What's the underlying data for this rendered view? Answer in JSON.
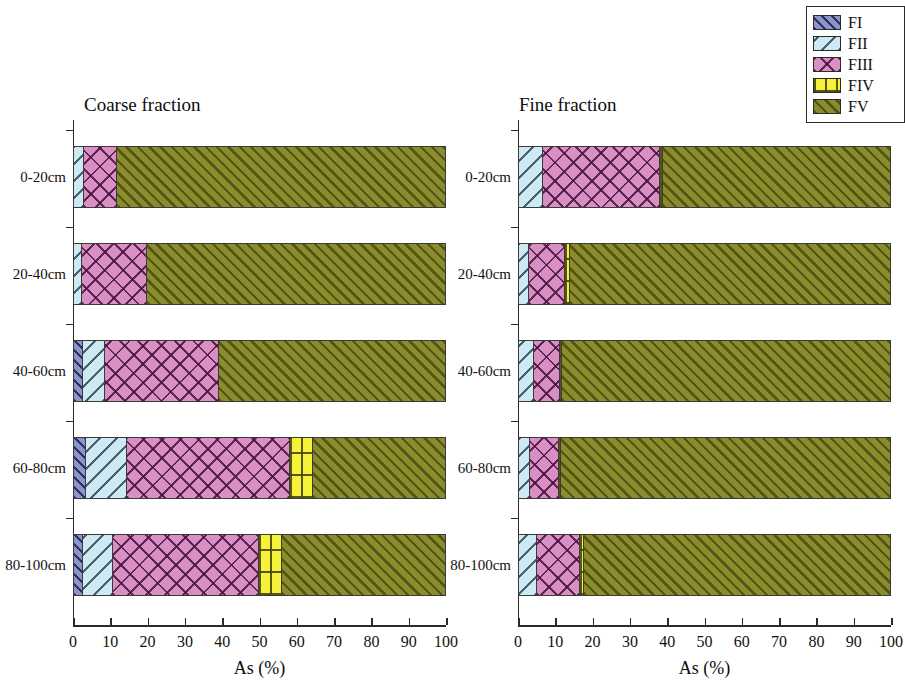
{
  "figure": {
    "axis_title": "As (%)",
    "xticks": [
      0,
      10,
      20,
      30,
      40,
      50,
      60,
      70,
      80,
      90,
      100
    ]
  },
  "legend": {
    "items": [
      {
        "key": "FI",
        "label": "FI",
        "color": "#8c96c6",
        "pattern": "diagonal-hatch"
      },
      {
        "key": "FII",
        "label": "FII",
        "color": "#cdeaf2",
        "pattern": "diagonal-hatch-reverse"
      },
      {
        "key": "FIII",
        "label": "FIII",
        "color": "#d98fc4",
        "pattern": "cross-hatch"
      },
      {
        "key": "FIV",
        "label": "FIV",
        "color": "#f6f139",
        "pattern": "grid"
      },
      {
        "key": "FV",
        "label": "FV",
        "color": "#8b8d2c",
        "pattern": "diagonal-hatch-dense"
      }
    ]
  },
  "panels": [
    {
      "id": "coarse",
      "title": "Coarse fraction",
      "rows": [
        {
          "label": "0-20cm",
          "values": {
            "FI": 0.0,
            "FII": 2.5,
            "FIII": 8.8,
            "FV": 88.7,
            "FIV": 0.0
          }
        },
        {
          "label": "20-40cm",
          "values": {
            "FI": 0.0,
            "FII": 1.9,
            "FIII": 17.4,
            "FV": 80.7,
            "FIV": 0.0
          }
        },
        {
          "label": "40-60cm",
          "values": {
            "FI": 2.1,
            "FII": 5.9,
            "FIII": 30.9,
            "FV": 61.1,
            "FIV": 0.0
          }
        },
        {
          "label": "60-80cm",
          "values": {
            "FI": 2.9,
            "FII": 11.0,
            "FIII": 44.0,
            "FIV": 6.2,
            "FV": 35.9
          }
        },
        {
          "label": "80-100cm",
          "values": {
            "FI": 2.1,
            "FII": 8.1,
            "FIII": 39.3,
            "FIV": 6.4,
            "FV": 44.1
          }
        }
      ]
    },
    {
      "id": "fine",
      "title": "Fine fraction",
      "rows": [
        {
          "label": "0-20cm",
          "values": {
            "FI": 0.0,
            "FII": 6.2,
            "FIII": 31.6,
            "FIV": 0.8,
            "FV": 61.4
          }
        },
        {
          "label": "20-40cm",
          "values": {
            "FI": 0.0,
            "FII": 2.4,
            "FIII": 9.7,
            "FIV": 1.3,
            "FV": 86.6
          }
        },
        {
          "label": "40-60cm",
          "values": {
            "FI": 0.0,
            "FII": 3.8,
            "FIII": 7.0,
            "FIV": 0.6,
            "FV": 88.6
          }
        },
        {
          "label": "60-80cm",
          "values": {
            "FI": 0.0,
            "FII": 2.7,
            "FIII": 7.8,
            "FIV": 0.6,
            "FV": 88.9
          }
        },
        {
          "label": "80-100cm",
          "values": {
            "FI": 0.0,
            "FII": 4.6,
            "FIII": 11.5,
            "FIV": 1.1,
            "FV": 82.8
          }
        }
      ]
    }
  ],
  "chart_data": {
    "type": "bar",
    "orientation": "horizontal",
    "stacked": true,
    "title": "",
    "xlabel": "As (%)",
    "ylabel": "",
    "xlim": [
      0,
      100
    ],
    "grid": false,
    "legend_position": "top-right",
    "categories": [
      "0-20cm",
      "20-40cm",
      "40-60cm",
      "60-80cm",
      "80-100cm"
    ],
    "panels": [
      {
        "name": "Coarse fraction",
        "series": [
          {
            "name": "FI",
            "values": [
              0.0,
              0.0,
              2.1,
              2.9,
              2.1
            ]
          },
          {
            "name": "FII",
            "values": [
              2.5,
              1.9,
              5.9,
              11.0,
              8.1
            ]
          },
          {
            "name": "FIII",
            "values": [
              8.8,
              17.4,
              30.9,
              44.0,
              39.3
            ]
          },
          {
            "name": "FIV",
            "values": [
              0.0,
              0.0,
              0.0,
              6.2,
              6.4
            ]
          },
          {
            "name": "FV",
            "values": [
              88.7,
              80.7,
              61.1,
              35.9,
              44.1
            ]
          }
        ]
      },
      {
        "name": "Fine fraction",
        "series": [
          {
            "name": "FI",
            "values": [
              0.0,
              0.0,
              0.0,
              0.0,
              0.0
            ]
          },
          {
            "name": "FII",
            "values": [
              6.2,
              2.4,
              3.8,
              2.7,
              4.6
            ]
          },
          {
            "name": "FIII",
            "values": [
              31.6,
              9.7,
              7.0,
              7.8,
              11.5
            ]
          },
          {
            "name": "FIV",
            "values": [
              0.8,
              1.3,
              0.6,
              0.6,
              1.1
            ]
          },
          {
            "name": "FV",
            "values": [
              61.4,
              86.6,
              88.6,
              88.9,
              82.8
            ]
          }
        ]
      }
    ]
  }
}
